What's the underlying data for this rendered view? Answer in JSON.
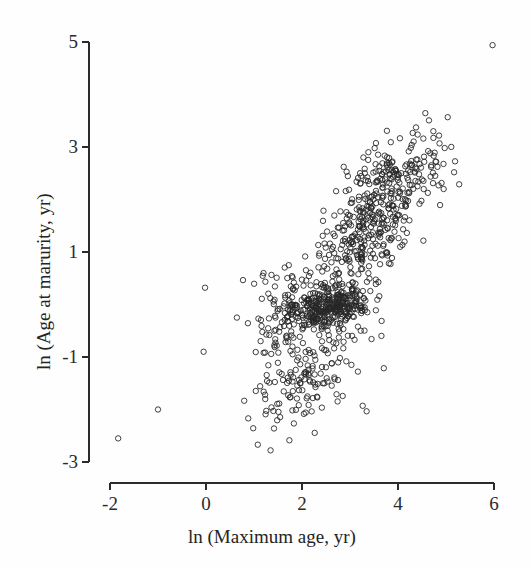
{
  "figure": {
    "width": 530,
    "height": 568,
    "background_color": "#fefefe",
    "ink_color": "#2b2b2b"
  },
  "chart_data": {
    "type": "scatter",
    "title": "",
    "xlabel": "ln (Maximum age, yr)",
    "ylabel": "ln (Age at marurity, yr)",
    "xlim": [
      -2,
      6
    ],
    "ylim": [
      -3,
      5
    ],
    "xticks": [
      -2,
      0,
      2,
      4,
      6
    ],
    "yticks": [
      -3,
      -1,
      1,
      3,
      5
    ],
    "xtick_labels": [
      "-2",
      "0",
      "2",
      "4",
      "6"
    ],
    "ytick_labels": [
      "-3",
      "-1",
      "1",
      "3",
      "5"
    ],
    "grid": false,
    "legend": null,
    "marker": {
      "shape": "open-circle",
      "diameter_px": 5.4,
      "edge_color": "#272727",
      "fill": "none",
      "edge_width": 1.0
    },
    "n_points_approx": 1020,
    "notable_points": [
      {
        "x": -1.83,
        "y": -2.55,
        "note": "lower-left outlier"
      },
      {
        "x": -1.0,
        "y": -2.0,
        "note": "lower-left outlier"
      },
      {
        "x": -0.02,
        "y": 0.32,
        "note": "isolated left point"
      },
      {
        "x": -0.05,
        "y": -0.9,
        "note": "isolated left point"
      },
      {
        "x": 5.97,
        "y": 4.94,
        "note": "top-right extreme outlier"
      }
    ],
    "cloud": {
      "x_range_main": [
        0.7,
        5.4
      ],
      "y_range_main": [
        -2.7,
        3.7
      ],
      "correlation_approx": 0.82,
      "regression_slope_approx": 0.95,
      "regression_intercept_approx": -2.35
    },
    "generator": {
      "seed": 20240517,
      "clusters": [
        {
          "n": 300,
          "mx": 2.55,
          "my": -0.05,
          "sx": 0.42,
          "sy": 0.22,
          "rho": 0.25,
          "note": "dense zero band"
        },
        {
          "n": 250,
          "mx": 3.25,
          "my": 1.15,
          "sx": 0.52,
          "sy": 0.6,
          "rho": 0.55,
          "note": "mid core"
        },
        {
          "n": 170,
          "mx": 3.7,
          "my": 2.25,
          "sx": 0.55,
          "sy": 0.52,
          "rho": 0.5,
          "note": "upper cluster"
        },
        {
          "n": 150,
          "mx": 2.15,
          "my": -1.35,
          "sx": 0.55,
          "sy": 0.55,
          "rho": 0.45,
          "note": "lower tail"
        },
        {
          "n": 100,
          "mx": 1.55,
          "my": -0.35,
          "sx": 0.38,
          "sy": 0.5,
          "rho": 0.35,
          "note": "left shoulder"
        },
        {
          "n": 45,
          "mx": 4.55,
          "my": 2.55,
          "sx": 0.45,
          "sy": 0.45,
          "rho": 0.4,
          "note": "right upper spur"
        }
      ]
    }
  },
  "axes": {
    "y_axis": {
      "x_px": 89,
      "top_px": 42,
      "bottom_px": 462,
      "tick_len_px": 7,
      "px_per_unit": 52.5
    },
    "x_axis": {
      "y_px": 483,
      "left_px": 110,
      "right_px": 494,
      "tick_len_px": 7,
      "px_per_unit": 48.0
    }
  }
}
